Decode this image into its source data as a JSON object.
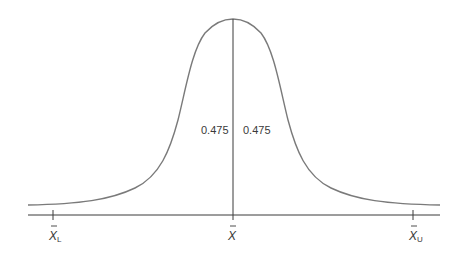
{
  "diagram": {
    "type": "normal-distribution-curve",
    "colors": {
      "curve": "#7a7a7a",
      "axis": "#3a3a3a",
      "text": "#3a3a3a"
    },
    "areas": {
      "left": "0.475",
      "right": "0.475"
    },
    "axis_labels": {
      "lower": {
        "base": "X",
        "sub": "L"
      },
      "center": {
        "base": "X"
      },
      "upper": {
        "base": "X",
        "sub": "U"
      }
    }
  }
}
